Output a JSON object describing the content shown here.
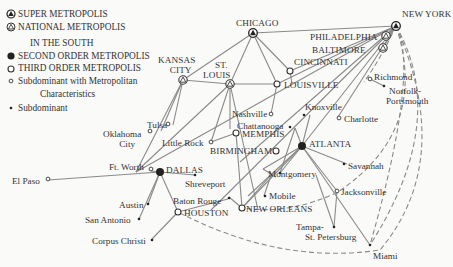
{
  "legend": {
    "super": "SUPER METROPOLIS",
    "national": "NATIONAL METROPOLIS",
    "heading": "IN THE SOUTH",
    "second": "SECOND ORDER METROPOLIS",
    "third": "THIRD ORDER METROPOLIS",
    "subdom_metro_1": "Subdominant with Metropolitan",
    "subdom_metro_2": "Characteristics",
    "subdom": "Subdominant"
  },
  "cities": {
    "new_york": "NEW YORK",
    "chicago": "CHICAGO",
    "philadelphia": "PHILADELPHIA",
    "baltimore": "BALTIMORE",
    "kansas_city_1": "KANSAS",
    "kansas_city_2": "CITY",
    "st_louis_1": "ST.",
    "st_louis_2": "LOUIS",
    "cincinnati": "CINCINNATI",
    "louisville": "LOUISVILLE",
    "richmond": "Richmond",
    "norfolk_1": "Norfolk-",
    "norfolk_2": "Portsmouth",
    "knoxville": "Knoxville",
    "charlotte": "Charlotte",
    "nashville": "Nashville",
    "chattanooga": "Chattanooga",
    "memphis": "MEMPHIS",
    "tulsa": "Tulsa",
    "oklahoma_1": "Oklahoma",
    "oklahoma_2": "City",
    "little_rock": "Little Rock",
    "atlanta": "ATLANTA",
    "birmingham": "BIRMINGHAM",
    "montgomery": "Montgomery",
    "savannah": "Savannah",
    "ft_worth": "Ft. Worth",
    "dallas": "DALLAS",
    "el_paso": "El Paso",
    "shreveport": "Shreveport",
    "mobile": "Mobile",
    "jacksonville": "Jacksonville",
    "austin": "Austin",
    "baton_rouge": "Baton Rouge",
    "houston": "HOUSTON",
    "new_orleans": "NEW ORLEANS",
    "san_antonio": "San Antonio",
    "tampa_1": "Tampa-",
    "tampa_2": "St. Petersburg",
    "corpus_christi": "Corpus Christi",
    "miami": "Miami"
  },
  "colors": {
    "line": "#8a8a8a",
    "ink": "#333333",
    "background": "#fafaf8"
  }
}
